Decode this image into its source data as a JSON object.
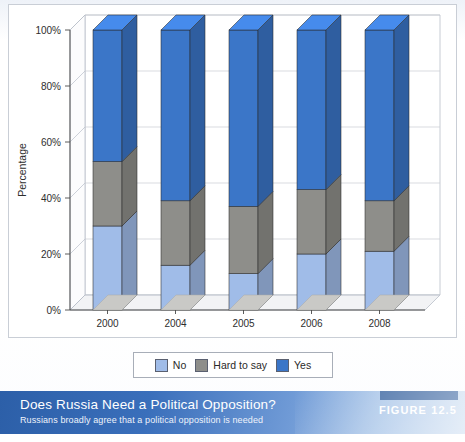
{
  "figure": {
    "number_label": "FIGURE 12.5",
    "title": "Does Russia Need a Political Opposition?",
    "subtitle": "Russians broadly agree that a political opposition is needed"
  },
  "legend": {
    "items": [
      {
        "label": "No",
        "color": "#a0bce8"
      },
      {
        "label": "Hard to say",
        "color": "#8e8e8a"
      },
      {
        "label": "Yes",
        "color": "#3b76c8"
      }
    ]
  },
  "axes": {
    "y_title": "Percentage",
    "y_ticks": [
      "0%",
      "20%",
      "40%",
      "60%",
      "80%",
      "100%"
    ],
    "x_ticks": [
      "2000",
      "2004",
      "2005",
      "2006",
      "2008"
    ]
  },
  "chart_data": {
    "type": "bar",
    "stacked": true,
    "three_d": true,
    "title": "Does Russia Need a Political Opposition?",
    "subtitle": "Russians broadly agree that a political opposition is needed",
    "xlabel": "",
    "ylabel": "Percentage",
    "ylim": [
      0,
      100
    ],
    "yticks": [
      0,
      20,
      40,
      60,
      80,
      100
    ],
    "ytick_labels": [
      "0%",
      "20%",
      "40%",
      "60%",
      "80%",
      "100%"
    ],
    "grid": true,
    "legend_position": "bottom",
    "categories": [
      "2000",
      "2004",
      "2005",
      "2006",
      "2008"
    ],
    "series": [
      {
        "name": "No",
        "color": "#a0bce8",
        "values": [
          30,
          16,
          13,
          20,
          21
        ]
      },
      {
        "name": "Hard to say",
        "color": "#8e8e8a",
        "values": [
          23,
          23,
          24,
          23,
          18
        ]
      },
      {
        "name": "Yes",
        "color": "#3b76c8",
        "values": [
          47,
          61,
          63,
          57,
          61
        ]
      }
    ]
  }
}
